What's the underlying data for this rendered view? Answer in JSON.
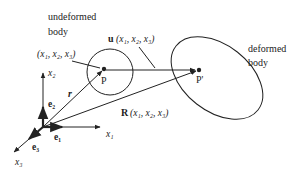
{
  "labels": {
    "undeformed_line1": "undeformed",
    "undeformed_line2": "body",
    "deformed_line1": "deformed",
    "deformed_line2": "body",
    "point_P": "P",
    "point_P_prime": "P'",
    "coords_P": "(x₁, x₂, x₃)",
    "vector_u": "u",
    "vector_u_args": "(x₁, x₂, x₃)",
    "vector_R": "R",
    "vector_R_args": "(x₁, x₂, x₃)",
    "vector_r": "r",
    "axis_x1": "x₁",
    "axis_x2": "x₂",
    "axis_x3": "x₃",
    "basis_e1": "e₁",
    "basis_e2": "e₂",
    "basis_e3": "e₃"
  },
  "colors": {
    "stroke": "#222222",
    "background": "#ffffff"
  }
}
